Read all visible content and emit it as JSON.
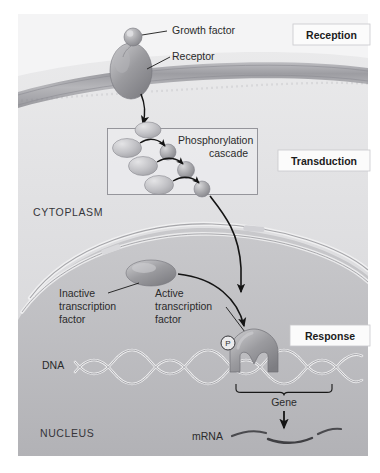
{
  "figure": {
    "title_alt": "Cell signaling pathway: reception, transduction, response",
    "background_color": "#ffffff",
    "canvas_color": "#d8d8da",
    "nucleus_color": "#b9b9bd",
    "membrane_color": "#a8a8ac",
    "protein_color": "#9a9a9e",
    "arrow_color": "#1a1a1a"
  },
  "stages": [
    {
      "id": "reception",
      "label": "Reception"
    },
    {
      "id": "transduction",
      "label": "Transduction"
    },
    {
      "id": "response",
      "label": "Response"
    }
  ],
  "callouts": [
    {
      "id": "growth-factor",
      "label": "Growth factor"
    },
    {
      "id": "receptor",
      "label": "Receptor"
    },
    {
      "id": "phosphorylation-cascade",
      "line1": "Phosphorylation",
      "line2": "cascade"
    },
    {
      "id": "inactive-transcription-factor",
      "line1": "Inactive",
      "line2": "transcription",
      "line3": "factor"
    },
    {
      "id": "active-transcription-factor",
      "line1": "Active",
      "line2": "transcription",
      "line3": "factor"
    }
  ],
  "compartments": [
    {
      "id": "cytoplasm",
      "label": "CYTOPLASM"
    },
    {
      "id": "nucleus",
      "label": "NUCLEUS"
    }
  ],
  "molecules": [
    {
      "id": "dna",
      "label": "DNA"
    },
    {
      "id": "gene",
      "label": "Gene"
    },
    {
      "id": "mrna",
      "label": "mRNA"
    },
    {
      "id": "phosphate",
      "label": "P"
    }
  ]
}
